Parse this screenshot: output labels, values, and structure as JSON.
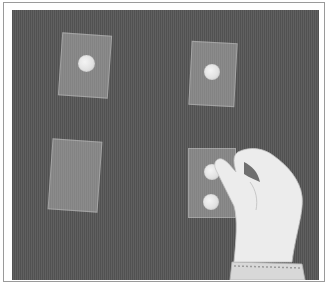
{
  "image": {
    "description": "Gray textured surface with four translucent plastic cards; three bear coins, and a hand places a coin on the bottom-right card",
    "colors": {
      "background": "#5a5a5a",
      "card": "#a8a8a8",
      "coin": "#e6e6e6",
      "hand": "#ececec",
      "frame": "#9a9a9a"
    },
    "cards": [
      {
        "position": "top-left",
        "coins": 1
      },
      {
        "position": "top-right",
        "coins": 1
      },
      {
        "position": "bottom-left",
        "coins": 0
      },
      {
        "position": "bottom-right",
        "coins": 2
      }
    ]
  }
}
